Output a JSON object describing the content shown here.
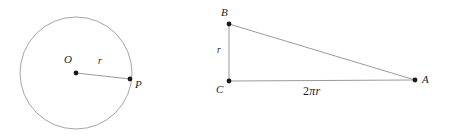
{
  "figure": {
    "background_color": "#ffffff",
    "line_color": "#8e8e8e",
    "dot_color": "#1a1a1a",
    "label_color": "#1e1e1e"
  },
  "circle_diagram": {
    "name": "circle-with-radius",
    "center_label": "O",
    "point_label": "P",
    "radius_label": "r",
    "center": {
      "x": 76,
      "y": 73
    },
    "radius_px": 56,
    "point_on_circle": {
      "x": 130,
      "y": 79
    }
  },
  "triangle_diagram": {
    "name": "right-triangle",
    "vertex_top_label": "B",
    "vertex_corner_label": "C",
    "vertex_right_label": "A",
    "leg_vertical_label": "r",
    "leg_horizontal_label": "2πr",
    "leg_horizontal_coefficient": "2",
    "leg_horizontal_symbol": "π",
    "leg_horizontal_variable": "r",
    "vertex_top": {
      "x": 229,
      "y": 24
    },
    "vertex_corner": {
      "x": 229,
      "y": 81
    },
    "vertex_right": {
      "x": 415,
      "y": 80
    }
  }
}
